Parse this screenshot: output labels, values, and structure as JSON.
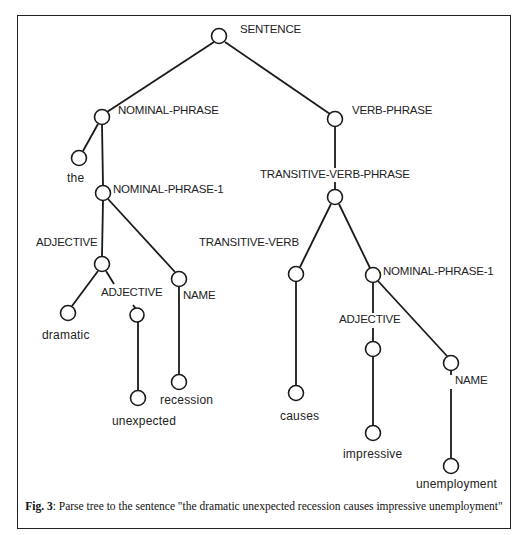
{
  "figure": {
    "caption_label": "Fig. 3",
    "caption_text": ": Parse tree to the sentence \"the dramatic unexpected recession causes impressive unemployment\""
  },
  "tree": {
    "nodes": {
      "sentence": "SENTENCE",
      "nominal_phrase": "NOMINAL-PHRASE",
      "the": "the",
      "nominal_phrase_1_left": "NOMINAL-PHRASE-1",
      "adjective_left": "ADJECTIVE",
      "dramatic": "dramatic",
      "adjective_left_2": "ADJECTIVE",
      "unexpected": "unexpected",
      "name_left": "NAME",
      "recession": "recession",
      "verb_phrase": "VERB-PHRASE",
      "transitive_verb_phrase": "TRANSITIVE-VERB-PHRASE",
      "transitive_verb": "TRANSITIVE-VERB",
      "causes": "causes",
      "nominal_phrase_1_right": "NOMINAL-PHRASE-1",
      "adjective_right": "ADJECTIVE",
      "impressive": "impressive",
      "name_right": "NAME",
      "unemployment": "unemployment"
    },
    "edges": [
      [
        "SENTENCE",
        "NOMINAL-PHRASE"
      ],
      [
        "SENTENCE",
        "VERB-PHRASE"
      ],
      [
        "NOMINAL-PHRASE",
        "the"
      ],
      [
        "NOMINAL-PHRASE",
        "NOMINAL-PHRASE-1"
      ],
      [
        "NOMINAL-PHRASE-1",
        "ADJECTIVE"
      ],
      [
        "NOMINAL-PHRASE-1",
        "NAME"
      ],
      [
        "ADJECTIVE",
        "dramatic"
      ],
      [
        "ADJECTIVE",
        "ADJECTIVE"
      ],
      [
        "ADJECTIVE",
        "unexpected"
      ],
      [
        "NAME",
        "recession"
      ],
      [
        "VERB-PHRASE",
        "TRANSITIVE-VERB-PHRASE"
      ],
      [
        "TRANSITIVE-VERB-PHRASE",
        "TRANSITIVE-VERB"
      ],
      [
        "TRANSITIVE-VERB-PHRASE",
        "NOMINAL-PHRASE-1"
      ],
      [
        "TRANSITIVE-VERB",
        "causes"
      ],
      [
        "NOMINAL-PHRASE-1",
        "ADJECTIVE"
      ],
      [
        "NOMINAL-PHRASE-1",
        "NAME"
      ],
      [
        "ADJECTIVE",
        "impressive"
      ],
      [
        "NAME",
        "unemployment"
      ]
    ]
  }
}
